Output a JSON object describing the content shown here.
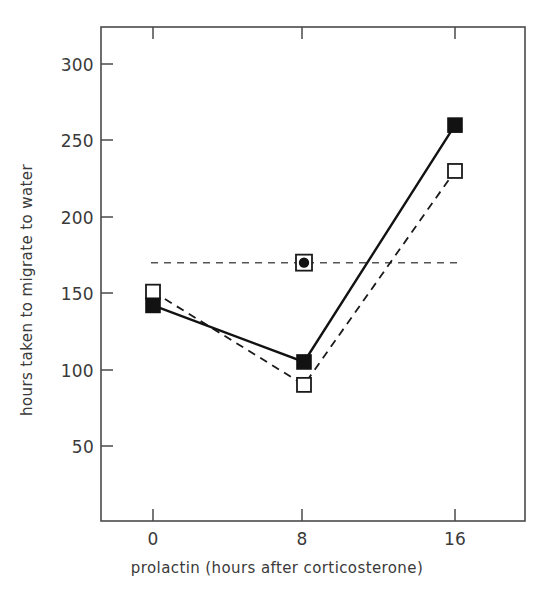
{
  "chart_data": {
    "type": "line",
    "title": "",
    "subtitle": "",
    "xlabel": "prolactin (hours after corticosterone)",
    "ylabel": "hours taken to migrate to water",
    "x": [
      0,
      8,
      16
    ],
    "xtick_labels": [
      "0",
      "8",
      "16"
    ],
    "ytick_labels": [
      "50",
      "100",
      "150",
      "200",
      "250",
      "300"
    ],
    "yticks": [
      50,
      100,
      150,
      200,
      250,
      300
    ],
    "xlim": [
      -4,
      20
    ],
    "ylim": [
      10,
      320
    ],
    "grid": false,
    "legend_position": "none",
    "series": [
      {
        "name": "filled-square-solid",
        "marker": "filled-square",
        "line_style": "solid",
        "color": "#1a1a1a",
        "values": [
          142,
          105,
          260
        ]
      },
      {
        "name": "open-square-dashed",
        "marker": "open-square",
        "line_style": "dashed",
        "color": "#1a1a1a",
        "values": [
          151,
          90,
          230
        ]
      }
    ],
    "annotations": [
      {
        "name": "reference-line",
        "type": "horizontal-dashed-line",
        "y": 170,
        "x_start": 0,
        "x_end": 16,
        "color": "#3a3a3a"
      },
      {
        "name": "reference-marker",
        "type": "square-with-dot",
        "x": 8,
        "y": 170,
        "color": "#1a1a1a"
      }
    ]
  },
  "axes": {
    "y_label": "hours taken to migrate to water",
    "x_label": "prolactin (hours after corticosterone)",
    "y_ticks": [
      "300",
      "250",
      "200",
      "150",
      "100",
      "50"
    ],
    "x_ticks": [
      "0",
      "8",
      "16"
    ]
  }
}
